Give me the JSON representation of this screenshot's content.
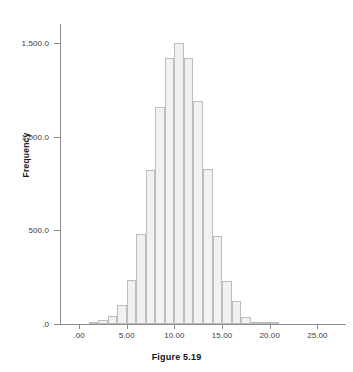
{
  "caption": "Figure 5.19",
  "axis": {
    "ylabel": "Frequency",
    "xlabel": ""
  },
  "chart_data": {
    "type": "bar",
    "title": "",
    "subtitle": "",
    "xlabel": "",
    "ylabel": "Frequency",
    "grid": false,
    "legend": null,
    "xlim": [
      -2.0,
      28.0
    ],
    "ylim": [
      0,
      1600
    ],
    "xticks": [
      0,
      5,
      10,
      15,
      20,
      25
    ],
    "xtick_labels": [
      ".00",
      "5.00",
      "10.00",
      "15.00",
      "20.00",
      "25.00"
    ],
    "yticks": [
      0,
      500,
      1000,
      1500
    ],
    "ytick_labels": [
      ".0",
      "500.0",
      "1,000.0",
      "1,500.0"
    ],
    "bin_width": 1,
    "categories": [
      "1.5",
      "2.5",
      "3.5",
      "4.5",
      "5.5",
      "6.5",
      "7.5",
      "8.5",
      "9.5",
      "10.5",
      "11.5",
      "12.5",
      "13.5",
      "14.5",
      "15.5",
      "16.5",
      "17.5",
      "18.5",
      "19.5",
      "20.5"
    ],
    "bin_centers": [
      1.5,
      2.5,
      3.5,
      4.5,
      5.5,
      6.5,
      7.5,
      8.5,
      9.5,
      10.5,
      11.5,
      12.5,
      13.5,
      14.5,
      15.5,
      16.5,
      17.5,
      18.5,
      19.5,
      20.5
    ],
    "values": [
      5,
      20,
      45,
      100,
      235,
      480,
      820,
      1155,
      1420,
      1500,
      1420,
      1190,
      825,
      470,
      230,
      125,
      35,
      8,
      3,
      2
    ],
    "bar_color": "#f1f1f1",
    "bar_edge_color": "#bdbdbd",
    "axis_color": "#8c8c8c"
  }
}
